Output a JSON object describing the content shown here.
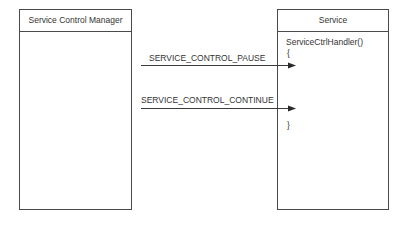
{
  "diagram": {
    "left_box": {
      "title": "Service Control Manager"
    },
    "right_box": {
      "title": "Service",
      "code": {
        "function": "ServiceCtrlHandler()",
        "open_brace": "{",
        "close_brace": "}"
      }
    },
    "messages": [
      {
        "label": "SERVICE_CONTROL_PAUSE",
        "from": "Service Control Manager",
        "to": "Service"
      },
      {
        "label": "SERVICE_CONTROL_CONTINUE",
        "from": "Service Control Manager",
        "to": "Service"
      }
    ],
    "colors": {
      "line": "#4a4a4a",
      "text": "#333333",
      "background": "#ffffff"
    }
  }
}
